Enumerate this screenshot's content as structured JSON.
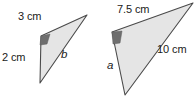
{
  "figure": {
    "type": "similar-triangles-diagram",
    "background_color": "#ffffff",
    "fill_color": "#e5e5e5",
    "stroke_color": "#4a4a4a",
    "angle_mark_color": "#6e6e6e",
    "text_color": "#1a1a1a",
    "triangles": [
      {
        "name": "left-triangle",
        "points": "87,15 41,36 40,83",
        "angle_mark_points": "41,36 50,34 47,44 40,45",
        "labels": {
          "top_side": "3 cm",
          "left_side": "2 cm",
          "hypotenuse": "b"
        }
      },
      {
        "name": "right-triangle",
        "points": "193,3 112,32 125,95",
        "angle_mark_points": "112,32 122,31 120,43 113,44",
        "labels": {
          "top_side": "7.5 cm",
          "hypotenuse": "10 cm",
          "left_side": "a"
        }
      }
    ]
  }
}
